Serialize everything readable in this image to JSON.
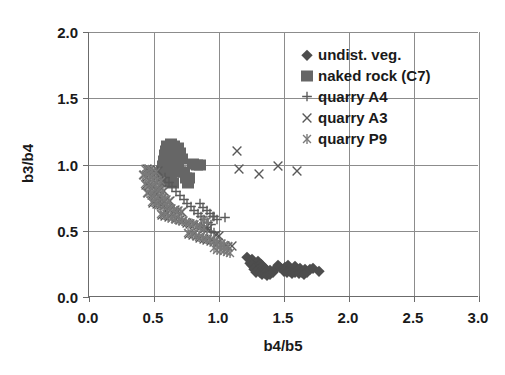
{
  "chart_data": {
    "type": "scatter",
    "title": "",
    "xlabel": "b4/b5",
    "ylabel": "b3/b4",
    "xlim": [
      0.0,
      3.0
    ],
    "ylim": [
      0.0,
      2.0
    ],
    "xticks": [
      "0.0",
      "0.5",
      "1.0",
      "1.5",
      "2.0",
      "2.5",
      "3.0"
    ],
    "yticks": [
      "0.0",
      "0.5",
      "1.0",
      "1.5",
      "2.0"
    ],
    "xtick_values": [
      0.0,
      0.5,
      1.0,
      1.5,
      2.0,
      2.5,
      3.0
    ],
    "ytick_values": [
      0.0,
      0.5,
      1.0,
      1.5,
      2.0
    ],
    "grid": true,
    "legend_position": "upper right",
    "series": [
      {
        "name": "undist. veg.",
        "marker": "diamond",
        "color": "#4d4d4d",
        "points": [
          [
            1.215,
            0.3
          ],
          [
            1.25,
            0.285
          ],
          [
            1.265,
            0.265
          ],
          [
            1.238,
            0.258
          ],
          [
            1.285,
            0.25
          ],
          [
            1.3,
            0.268
          ],
          [
            1.252,
            0.24
          ],
          [
            1.28,
            0.228
          ],
          [
            1.305,
            0.24
          ],
          [
            1.322,
            0.252
          ],
          [
            1.268,
            0.215
          ],
          [
            1.295,
            0.205
          ],
          [
            1.318,
            0.22
          ],
          [
            1.34,
            0.232
          ],
          [
            1.288,
            0.192
          ],
          [
            1.312,
            0.185
          ],
          [
            1.335,
            0.2
          ],
          [
            1.358,
            0.212
          ],
          [
            1.33,
            0.172
          ],
          [
            1.352,
            0.182
          ],
          [
            1.372,
            0.195
          ],
          [
            1.395,
            0.205
          ],
          [
            1.368,
            0.165
          ],
          [
            1.39,
            0.172
          ],
          [
            1.412,
            0.185
          ],
          [
            1.438,
            0.22
          ],
          [
            1.455,
            0.238
          ],
          [
            1.47,
            0.225
          ],
          [
            1.492,
            0.212
          ],
          [
            1.51,
            0.228
          ],
          [
            1.528,
            0.242
          ],
          [
            1.545,
            0.222
          ],
          [
            1.5,
            0.195
          ],
          [
            1.522,
            0.188
          ],
          [
            1.548,
            0.2
          ],
          [
            1.568,
            0.215
          ],
          [
            1.585,
            0.232
          ],
          [
            1.56,
            0.178
          ],
          [
            1.582,
            0.188
          ],
          [
            1.605,
            0.205
          ],
          [
            1.625,
            0.218
          ],
          [
            1.612,
            0.182
          ],
          [
            1.635,
            0.192
          ],
          [
            1.658,
            0.208
          ],
          [
            1.65,
            0.172
          ],
          [
            1.675,
            0.185
          ],
          [
            1.7,
            0.212
          ],
          [
            1.722,
            0.222
          ],
          [
            1.77,
            0.198
          ]
        ]
      },
      {
        "name": "naked rock (C7)",
        "marker": "square",
        "color": "#666666",
        "points": [
          [
            0.6,
            1.14
          ],
          [
            0.628,
            1.155
          ],
          [
            0.655,
            1.14
          ],
          [
            0.682,
            1.128
          ],
          [
            0.592,
            1.105
          ],
          [
            0.618,
            1.112
          ],
          [
            0.645,
            1.105
          ],
          [
            0.672,
            1.095
          ],
          [
            0.7,
            1.085
          ],
          [
            0.582,
            1.068
          ],
          [
            0.608,
            1.072
          ],
          [
            0.635,
            1.068
          ],
          [
            0.662,
            1.06
          ],
          [
            0.69,
            1.052
          ],
          [
            0.718,
            1.042
          ],
          [
            0.575,
            1.03
          ],
          [
            0.602,
            1.035
          ],
          [
            0.628,
            1.03
          ],
          [
            0.655,
            1.022
          ],
          [
            0.682,
            1.015
          ],
          [
            0.8,
            1.005
          ],
          [
            0.828,
            1.0
          ],
          [
            0.855,
            0.995
          ],
          [
            0.568,
            0.992
          ],
          [
            0.595,
            0.995
          ],
          [
            0.622,
            0.99
          ],
          [
            0.648,
            0.982
          ],
          [
            0.675,
            0.975
          ],
          [
            0.562,
            0.952
          ],
          [
            0.588,
            0.958
          ],
          [
            0.615,
            0.952
          ],
          [
            0.7,
            0.945
          ],
          [
            0.728,
            0.94
          ],
          [
            0.578,
            0.915
          ],
          [
            0.605,
            0.912
          ],
          [
            0.632,
            0.905
          ],
          [
            0.745,
            0.9
          ],
          [
            0.772,
            0.895
          ],
          [
            0.595,
            0.872
          ],
          [
            0.622,
            0.868
          ],
          [
            0.648,
            0.86
          ],
          [
            0.758,
            0.862
          ]
        ]
      },
      {
        "name": "quarry A4",
        "marker": "plus",
        "color": "#595959",
        "points": [
          [
            0.585,
            0.9
          ],
          [
            0.612,
            0.862
          ],
          [
            0.64,
            0.828
          ],
          [
            0.668,
            0.795
          ],
          [
            0.7,
            0.765
          ],
          [
            0.728,
            0.735
          ],
          [
            0.755,
            0.705
          ],
          [
            0.782,
            0.678
          ],
          [
            0.81,
            0.652
          ],
          [
            0.838,
            0.628
          ],
          [
            0.862,
            0.605
          ],
          [
            0.888,
            0.582
          ],
          [
            0.915,
            0.562
          ],
          [
            0.942,
            0.542
          ],
          [
            0.852,
            0.7
          ],
          [
            0.878,
            0.672
          ],
          [
            0.905,
            0.648
          ],
          [
            0.932,
            0.625
          ],
          [
            0.958,
            0.602
          ],
          [
            0.985,
            0.58
          ],
          [
            0.955,
            0.602
          ],
          [
            1.045,
            0.6
          ],
          [
            0.908,
            0.505
          ],
          [
            0.935,
            0.492
          ],
          [
            0.962,
            0.48
          ],
          [
            0.862,
            0.528
          ],
          [
            0.888,
            0.518
          ]
        ]
      },
      {
        "name": "quarry A3",
        "marker": "ex",
        "color": "#595959",
        "points": [
          [
            0.445,
            0.965
          ],
          [
            0.472,
            0.958
          ],
          [
            0.5,
            0.952
          ],
          [
            0.528,
            0.948
          ],
          [
            0.42,
            0.918
          ],
          [
            0.448,
            0.905
          ],
          [
            0.475,
            0.895
          ],
          [
            0.502,
            0.885
          ],
          [
            0.532,
            0.875
          ],
          [
            0.56,
            0.868
          ],
          [
            0.438,
            0.845
          ],
          [
            0.465,
            0.838
          ],
          [
            0.492,
            0.828
          ],
          [
            0.52,
            0.818
          ],
          [
            0.548,
            0.808
          ],
          [
            0.578,
            0.798
          ],
          [
            0.455,
            0.782
          ],
          [
            0.482,
            0.772
          ],
          [
            0.51,
            0.762
          ],
          [
            0.538,
            0.752
          ],
          [
            0.565,
            0.742
          ],
          [
            0.592,
            0.732
          ],
          [
            0.62,
            0.722
          ],
          [
            0.495,
            0.712
          ],
          [
            0.522,
            0.702
          ],
          [
            0.55,
            0.692
          ],
          [
            0.578,
            0.685
          ],
          [
            0.605,
            0.675
          ],
          [
            0.632,
            0.665
          ],
          [
            0.66,
            0.655
          ],
          [
            0.688,
            0.648
          ],
          [
            0.715,
            0.638
          ],
          [
            0.56,
            0.622
          ],
          [
            0.588,
            0.612
          ],
          [
            0.615,
            0.605
          ],
          [
            0.642,
            0.595
          ],
          [
            0.67,
            0.588
          ],
          [
            0.698,
            0.578
          ],
          [
            0.725,
            0.57
          ],
          [
            0.752,
            0.562
          ],
          [
            0.78,
            0.552
          ],
          [
            0.808,
            0.545
          ],
          [
            0.835,
            0.535
          ],
          [
            0.862,
            0.528
          ],
          [
            0.89,
            0.52
          ],
          [
            0.915,
            0.512
          ],
          [
            0.772,
            0.478
          ],
          [
            0.8,
            0.468
          ],
          [
            0.828,
            0.458
          ],
          [
            0.855,
            0.448
          ],
          [
            0.882,
            0.44
          ],
          [
            0.908,
            0.432
          ],
          [
            0.935,
            0.425
          ],
          [
            0.962,
            0.418
          ],
          [
            0.99,
            0.408
          ],
          [
            1.018,
            0.398
          ],
          [
            1.045,
            0.388
          ],
          [
            1.072,
            0.378
          ],
          [
            1.14,
            1.1
          ],
          [
            1.305,
            0.93
          ],
          [
            1.152,
            0.965
          ],
          [
            1.45,
            0.985
          ],
          [
            1.6,
            0.95
          ],
          [
            1.102,
            0.382
          ],
          [
            0.975,
            0.47
          ],
          [
            1.002,
            0.462
          ]
        ]
      },
      {
        "name": "quarry P9",
        "marker": "star",
        "color": "#7a7a7a",
        "points": [
          [
            0.432,
            0.965
          ],
          [
            0.46,
            0.958
          ],
          [
            0.488,
            0.95
          ],
          [
            0.515,
            0.942
          ],
          [
            0.412,
            0.922
          ],
          [
            0.44,
            0.912
          ],
          [
            0.468,
            0.902
          ],
          [
            0.496,
            0.892
          ],
          [
            0.525,
            0.882
          ],
          [
            0.552,
            0.872
          ],
          [
            0.43,
            0.852
          ],
          [
            0.458,
            0.842
          ],
          [
            0.485,
            0.832
          ],
          [
            0.512,
            0.822
          ],
          [
            0.54,
            0.812
          ],
          [
            0.568,
            0.802
          ],
          [
            0.448,
            0.788
          ],
          [
            0.475,
            0.778
          ],
          [
            0.502,
            0.768
          ],
          [
            0.53,
            0.758
          ],
          [
            0.558,
            0.748
          ],
          [
            0.585,
            0.738
          ],
          [
            0.612,
            0.728
          ],
          [
            0.488,
            0.718
          ],
          [
            0.515,
            0.708
          ],
          [
            0.542,
            0.698
          ],
          [
            0.57,
            0.688
          ],
          [
            0.598,
            0.678
          ],
          [
            0.625,
            0.67
          ],
          [
            0.652,
            0.66
          ],
          [
            0.68,
            0.652
          ],
          [
            0.708,
            0.642
          ],
          [
            0.552,
            0.628
          ],
          [
            0.58,
            0.618
          ],
          [
            0.608,
            0.61
          ],
          [
            0.635,
            0.6
          ],
          [
            0.662,
            0.592
          ],
          [
            0.69,
            0.582
          ],
          [
            0.718,
            0.572
          ],
          [
            0.745,
            0.565
          ],
          [
            0.772,
            0.555
          ],
          [
            0.8,
            0.548
          ],
          [
            0.828,
            0.538
          ],
          [
            0.855,
            0.53
          ],
          [
            0.882,
            0.522
          ],
          [
            0.765,
            0.482
          ],
          [
            0.792,
            0.472
          ],
          [
            0.82,
            0.462
          ],
          [
            0.848,
            0.452
          ],
          [
            0.875,
            0.442
          ],
          [
            0.902,
            0.435
          ],
          [
            0.93,
            0.428
          ],
          [
            0.958,
            0.42
          ],
          [
            0.985,
            0.412
          ],
          [
            1.012,
            0.402
          ],
          [
            1.04,
            0.392
          ],
          [
            1.068,
            0.382
          ],
          [
            0.958,
            0.368
          ],
          [
            0.985,
            0.358
          ],
          [
            1.012,
            0.352
          ],
          [
            1.04,
            0.345
          ],
          [
            1.058,
            0.338
          ],
          [
            1.085,
            0.33
          ],
          [
            0.88,
            0.582
          ],
          [
            0.908,
            0.572
          ]
        ]
      }
    ]
  },
  "legend": {
    "entries": [
      {
        "label": "undist. veg.",
        "marker": "diamond"
      },
      {
        "label": "naked rock (C7)",
        "marker": "square"
      },
      {
        "label": "quarry A4",
        "marker": "plus"
      },
      {
        "label": "quarry A3",
        "marker": "ex"
      },
      {
        "label": "quarry P9",
        "marker": "star"
      }
    ]
  },
  "colors": {
    "diamond": "#4d4d4d",
    "square": "#666666",
    "plus": "#595959",
    "ex": "#595959",
    "star": "#7a7a7a",
    "axis": "#6b6b6b",
    "grid": "#8c8c8c",
    "text": "#1a1a1a"
  }
}
